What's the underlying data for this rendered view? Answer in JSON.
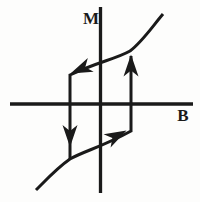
{
  "theme": {
    "ink": "#1a1a1a",
    "background": "#fdfdfc"
  },
  "diagram": {
    "kind": "magnetic-hysteresis-loop",
    "axes": {
      "m_label": "M",
      "b_label": "B",
      "m_axis_d": "M 100.5 7 L 100.5 193",
      "b_axis_d": "M 10 104 L 193 104"
    },
    "loop": {
      "upper_branch_and_left_side_d": "M 163 14 C 152 27 142 42 130 51 C 116 59 97 62 70 75 L 70 159",
      "lower_branch_and_right_side_d": "M 36 190 C 46 180 57 168 70 159 C 84 151 102 147 131 131 L 131 56"
    },
    "arrows": {
      "left": {
        "direction": "left",
        "points": "0,0 -22,-7.5 -16,0 -22,7.5",
        "transform": "translate(70.5,73.5) rotate(157)"
      },
      "down": {
        "direction": "down",
        "points": "0,0 -22,-7.5 -16,0 -22,7.5",
        "transform": "translate(70,147) rotate(90)"
      },
      "up": {
        "direction": "up",
        "points": "0,0 -22,-7.5 -16,0 -22,7.5",
        "transform": "translate(131,54.5) rotate(-90)"
      },
      "right": {
        "direction": "right",
        "points": "0,0 -22,-7.5 -16,0 -22,7.5",
        "transform": "translate(126.5,130.5) rotate(-28)"
      }
    }
  }
}
